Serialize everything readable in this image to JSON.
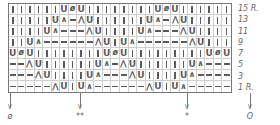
{
  "chart": {
    "columns": 26,
    "rows_count": 8,
    "repeat_width": 12,
    "legend_symbols": {
      "I": "knit",
      "U": "yarn-over",
      "ø": "double-decrease",
      "/": "k2tog",
      "\\": "ssk",
      "-": "no-stitch"
    },
    "rows": [
      {
        "label": "15 R.",
        "cells": [
          "I",
          "I",
          "I",
          "I",
          "I",
          "I",
          "U",
          "ø",
          "U",
          "I",
          "I",
          "I",
          "I",
          "I",
          "I",
          "I",
          "I",
          "U",
          "ø",
          "U",
          "I",
          "I",
          "I",
          "I",
          "I",
          "I"
        ]
      },
      {
        "label": "13",
        "cells": [
          "I",
          "I",
          "I",
          "I",
          "I",
          "U",
          "/",
          "-",
          "\\",
          "U",
          "I",
          "I",
          "I",
          "I",
          "I",
          "I",
          "U",
          "/",
          "-",
          "\\",
          "U",
          "I",
          "I",
          "I",
          "I",
          "I"
        ]
      },
      {
        "label": "11",
        "cells": [
          "I",
          "I",
          "I",
          "I",
          "U",
          "/",
          "-",
          "-",
          "-",
          "\\",
          "U",
          "I",
          "I",
          "I",
          "I",
          "U",
          "/",
          "-",
          "-",
          "-",
          "\\",
          "U",
          "I",
          "I",
          "I",
          "I"
        ]
      },
      {
        "label": "9",
        "cells": [
          "I",
          "I",
          "U",
          "/",
          "-",
          "-",
          "-",
          "-",
          "-",
          "-",
          "\\",
          "U",
          "I",
          "U",
          "/",
          "-",
          "-",
          "-",
          "-",
          "-",
          "-",
          "\\",
          "U",
          "I",
          "I",
          "I"
        ]
      },
      {
        "label": "7",
        "cells": [
          "U",
          "ø",
          "U",
          "I",
          "I",
          "I",
          "I",
          "I",
          "I",
          "I",
          "I",
          "U",
          "ø",
          "U",
          "I",
          "I",
          "I",
          "I",
          "I",
          "I",
          "I",
          "I",
          "I",
          "U",
          "ø",
          "U"
        ]
      },
      {
        "label": "5",
        "cells": [
          "-",
          "-",
          "\\",
          "U",
          "I",
          "I",
          "I",
          "I",
          "I",
          "I",
          "U",
          "/",
          "-",
          "\\",
          "U",
          "I",
          "I",
          "I",
          "I",
          "I",
          "I",
          "U",
          "/",
          "-",
          "-",
          "-"
        ]
      },
      {
        "label": "3",
        "cells": [
          "-",
          "-",
          "-",
          "\\",
          "U",
          "I",
          "I",
          "I",
          "I",
          "U",
          "/",
          "-",
          "-",
          "-",
          "\\",
          "U",
          "I",
          "I",
          "I",
          "I",
          "U",
          "/",
          "-",
          "-",
          "-",
          "-"
        ]
      },
      {
        "label": "1 R.",
        "cells": [
          "-",
          "-",
          "-",
          "-",
          "-",
          "\\",
          "U",
          "I",
          "U",
          "/",
          "-",
          "-",
          "-",
          "-",
          "-",
          "-",
          "\\",
          "U",
          "I",
          "U",
          "/",
          "-",
          "-",
          "-",
          "-",
          "-"
        ]
      }
    ]
  },
  "markers": [
    {
      "symbol": "ø",
      "x": 10
    },
    {
      "symbol": "**",
      "x": 80
    },
    {
      "symbol": "*",
      "x": 187
    },
    {
      "symbol": "O",
      "x": 250
    }
  ]
}
